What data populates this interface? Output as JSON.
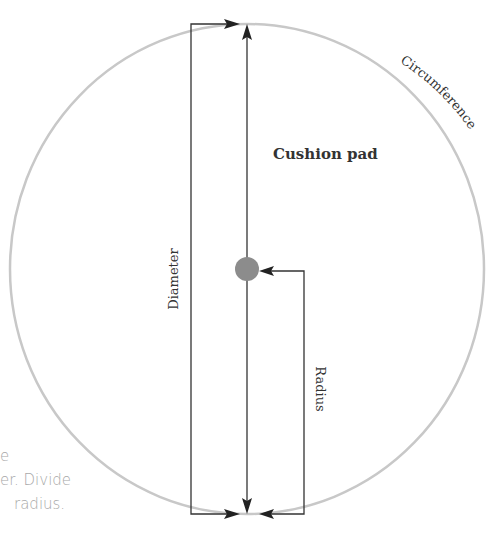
{
  "diagram": {
    "title_label": "Cushion pad",
    "circumference_label": "Circumference",
    "diameter_label": "Diameter",
    "radius_label": "Radius",
    "colors": {
      "circle_stroke": "#c8c8c8",
      "line_stroke": "#333333",
      "center_dot": "#8c8c8c",
      "side_text": "#a8a8a8"
    }
  },
  "side_text": {
    "lines": [
      "e",
      "er. Divide",
      "radius."
    ]
  }
}
